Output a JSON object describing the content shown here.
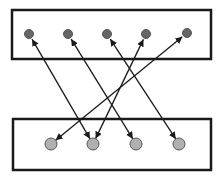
{
  "diagram": {
    "colors": {
      "background": "#ffffff",
      "box_stroke": "#1a1a1a",
      "edge_stroke": "#1a1a1a",
      "top_node_fill": "#666666",
      "bottom_node_fill": "#b0b0b0",
      "node_stroke": "#555555"
    },
    "boxes": [
      {
        "id": "top-box",
        "x": 12,
        "y": 10,
        "w": 199,
        "h": 49
      },
      {
        "id": "bottom-box",
        "x": 13,
        "y": 119,
        "w": 198,
        "h": 51
      }
    ],
    "top_nodes": [
      {
        "id": "t1",
        "x": 29,
        "y": 34
      },
      {
        "id": "t2",
        "x": 68,
        "y": 34
      },
      {
        "id": "t3",
        "x": 107,
        "y": 34
      },
      {
        "id": "t4",
        "x": 146,
        "y": 34
      },
      {
        "id": "t5",
        "x": 187,
        "y": 33
      }
    ],
    "bottom_nodes": [
      {
        "id": "b1",
        "x": 51,
        "y": 144
      },
      {
        "id": "b2",
        "x": 93,
        "y": 144
      },
      {
        "id": "b3",
        "x": 136,
        "y": 144
      },
      {
        "id": "b4",
        "x": 179,
        "y": 144
      }
    ],
    "edges": [
      {
        "from": "t1",
        "to": "b2",
        "bidirectional": true
      },
      {
        "from": "t2",
        "to": "b3",
        "bidirectional": true
      },
      {
        "from": "t3",
        "to": "b4",
        "bidirectional": true
      },
      {
        "from": "t4",
        "to": "b2",
        "bidirectional": true
      },
      {
        "from": "t5",
        "to": "b1",
        "bidirectional": true
      }
    ]
  }
}
